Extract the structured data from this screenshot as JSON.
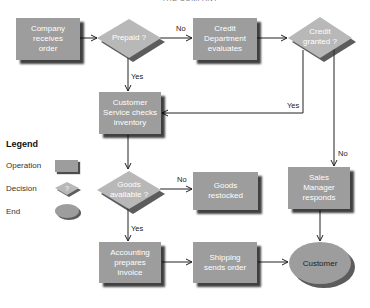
{
  "diagram": {
    "top_title": "THE COMPANY",
    "nodes": {
      "company_receives_order": {
        "type": "operation",
        "label": "Company\nreceives\norder"
      },
      "prepaid": {
        "type": "decision",
        "label": "Prepaid ?"
      },
      "credit_department": {
        "type": "operation",
        "label": "Credit\nDepartment\nevaluates"
      },
      "credit_granted": {
        "type": "decision",
        "label": "Credit\ngranted ?"
      },
      "customer_service": {
        "type": "operation",
        "label": "Customer\nService checks\ninventory"
      },
      "goods_available": {
        "type": "decision",
        "label": "Goods\navailable ?"
      },
      "goods_restocked": {
        "type": "operation",
        "label": "Goods\nrestocked"
      },
      "sales_manager": {
        "type": "operation",
        "label": "Sales\nManager\nresponds"
      },
      "accounting": {
        "type": "operation",
        "label": "Accounting\nprepares\ninvoice"
      },
      "shipping": {
        "type": "operation",
        "label": "Shipping\nsends order"
      },
      "customer": {
        "type": "end",
        "label": "Customer"
      }
    },
    "edge_labels": {
      "prepaid_no": "No",
      "prepaid_yes": "Yes",
      "credit_yes": "Yes",
      "credit_no": "No",
      "goods_no": "No",
      "goods_yes": "Yes"
    },
    "edges": [
      {
        "from": "company_receives_order",
        "to": "prepaid"
      },
      {
        "from": "prepaid",
        "to": "credit_department",
        "label": "No"
      },
      {
        "from": "prepaid",
        "to": "customer_service",
        "label": "Yes"
      },
      {
        "from": "credit_department",
        "to": "credit_granted"
      },
      {
        "from": "credit_granted",
        "to": "customer_service",
        "label": "Yes"
      },
      {
        "from": "credit_granted",
        "to": "sales_manager",
        "label": "No"
      },
      {
        "from": "customer_service",
        "to": "goods_available"
      },
      {
        "from": "goods_available",
        "to": "goods_restocked",
        "label": "No"
      },
      {
        "from": "goods_available",
        "to": "accounting",
        "label": "Yes"
      },
      {
        "from": "accounting",
        "to": "shipping"
      },
      {
        "from": "shipping",
        "to": "customer"
      },
      {
        "from": "sales_manager",
        "to": "customer"
      }
    ]
  },
  "legend": {
    "title": "Legend",
    "items": [
      {
        "label": "Operation",
        "shape": "rectangle"
      },
      {
        "label": "Decision",
        "shape": "diamond",
        "symbol": "?"
      },
      {
        "label": "End",
        "shape": "ellipse"
      }
    ]
  },
  "colors": {
    "shape_fill": "#9d9d9d",
    "diamond_fill": "#b8b8b8",
    "shadow": "#333333",
    "line": "#222222",
    "background": "#ffffff"
  }
}
